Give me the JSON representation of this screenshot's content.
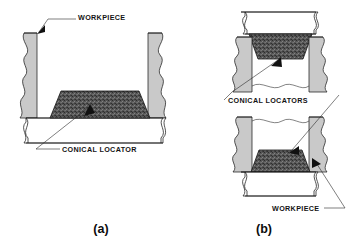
{
  "figure": {
    "title": "Conical Locators",
    "colors": {
      "block_gray": "#c9c9c9",
      "locator_dark": "#4a4a4a",
      "plate_white": "#ffffff",
      "line_black": "#1a1a1a",
      "text_black": "#141414",
      "background": "#ffffff"
    },
    "panels": [
      {
        "id": "a",
        "caption": "(a)",
        "caption_x": 101,
        "caption_y": 233,
        "labels": [
          {
            "name": "workpiece-label-a",
            "text": "WORKPIECE",
            "x": 78,
            "y": 20,
            "anchor": "start"
          },
          {
            "name": "conical-locator-label-a",
            "text": "CONICAL LOCATOR",
            "x": 62,
            "y": 152,
            "anchor": "start"
          }
        ]
      },
      {
        "id": "b",
        "caption": "(b)",
        "caption_x": 264,
        "caption_y": 233,
        "labels": [
          {
            "name": "conical-locators-label-b",
            "text": "CONICAL LOCATORS",
            "x": 228,
            "y": 103,
            "anchor": "start"
          },
          {
            "name": "workpiece-label-b",
            "text": "WORKPIECE",
            "x": 272,
            "y": 211,
            "anchor": "start"
          }
        ]
      }
    ]
  }
}
